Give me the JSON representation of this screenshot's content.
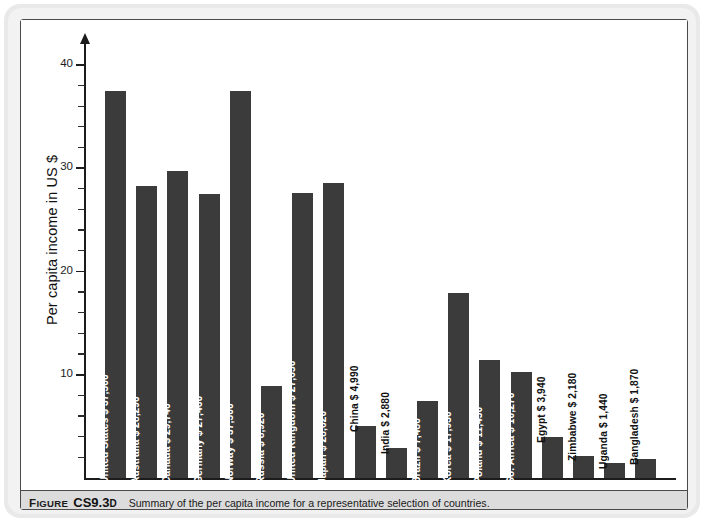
{
  "figure": {
    "caption_prefix_f": "F",
    "caption_prefix_rest": "IGURE",
    "caption_number_main": "CS9.3",
    "caption_number_suffix": "D",
    "caption_text": "Summary of the per capita income for a representative selection of countries."
  },
  "colors": {
    "bar": "#3b3b3b",
    "axis": "#1c1c1c",
    "caption_band": "#dcdcdc",
    "page_backing": "#e9e9e9"
  },
  "chart_data": {
    "type": "bar",
    "title": "",
    "xlabel": "",
    "ylabel": "Per capita income in US $",
    "ylim": [
      0,
      40
    ],
    "ytick_labels": [
      "10",
      "20",
      "30",
      "40"
    ],
    "ytick_values": [
      10,
      20,
      30,
      40
    ],
    "ytick_minor_step": 2,
    "grid": false,
    "legend": "none",
    "units": "thousands of US $",
    "categories": [
      "United States",
      "Australia",
      "Canada",
      "Germany",
      "Norway",
      "Russia",
      "United Kingdom",
      "Japan",
      "China",
      "India",
      "Brazil",
      "Korea",
      "Poland",
      "So. Africa",
      "Egypt",
      "Zimbabwe",
      "Uganda",
      "Bangladesh"
    ],
    "values": [
      37.5,
      28.29,
      29.74,
      27.46,
      37.5,
      8.92,
      27.65,
      28.62,
      4.99,
      2.88,
      7.48,
      17.93,
      11.45,
      10.27,
      3.94,
      2.18,
      1.44,
      1.87
    ],
    "bars": [
      {
        "label": "United States  $ 37,500",
        "country": "United States",
        "amount": "$ 37,500",
        "value": 37.5,
        "label_inside": true
      },
      {
        "label": "Australia  $ 28,290",
        "country": "Australia",
        "amount": "$ 28,290",
        "value": 28.29,
        "label_inside": true
      },
      {
        "label": "Canada  $ 29,740",
        "country": "Canada",
        "amount": "$ 29,740",
        "value": 29.74,
        "label_inside": true
      },
      {
        "label": "Germany  $ 27,460",
        "country": "Germany",
        "amount": "$ 27,460",
        "value": 27.46,
        "label_inside": true
      },
      {
        "label": "Norway  $ 37,500",
        "country": "Norway",
        "amount": "$ 37,500",
        "value": 37.5,
        "label_inside": true
      },
      {
        "label": "Russia  $ 8,920",
        "country": "Russia",
        "amount": "$ 8,920",
        "value": 8.92,
        "label_inside": true
      },
      {
        "label": "United Kingdom  $ 27,650",
        "country": "United Kingdom",
        "amount": "$ 27,650",
        "value": 27.65,
        "label_inside": true
      },
      {
        "label": "Japan  $ 28,620",
        "country": "Japan",
        "amount": "$ 28,620",
        "value": 28.62,
        "label_inside": true
      },
      {
        "label": "China  $ 4,990",
        "country": "China",
        "amount": "$ 4,990",
        "value": 4.99,
        "label_inside": false
      },
      {
        "label": "India  $ 2,880",
        "country": "India",
        "amount": "$ 2,880",
        "value": 2.88,
        "label_inside": false
      },
      {
        "label": "Brazil  $ 7,480",
        "country": "Brazil",
        "amount": "$ 7,480",
        "value": 7.48,
        "label_inside": true
      },
      {
        "label": "Korea  $ 17,930",
        "country": "Korea",
        "amount": "$ 17,930",
        "value": 17.93,
        "label_inside": true
      },
      {
        "label": "Poland  $ 11,450",
        "country": "Poland",
        "amount": "$ 11,450",
        "value": 11.45,
        "label_inside": true
      },
      {
        "label": "So. Africa  $ 10,270",
        "country": "So. Africa",
        "amount": "$ 10,270",
        "value": 10.27,
        "label_inside": true
      },
      {
        "label": "Egypt  $ 3,940",
        "country": "Egypt",
        "amount": "$ 3,940",
        "value": 3.94,
        "label_inside": false
      },
      {
        "label": "Zimbabwe  $ 2,180",
        "country": "Zimbabwe",
        "amount": "$ 2,180",
        "value": 2.18,
        "label_inside": false
      },
      {
        "label": "Uganda  $ 1,440",
        "country": "Uganda",
        "amount": "$ 1,440",
        "value": 1.44,
        "label_inside": false
      },
      {
        "label": "Bangladesh  $ 1,870",
        "country": "Bangladesh",
        "amount": "$ 1,870",
        "value": 1.87,
        "label_inside": false
      }
    ]
  }
}
